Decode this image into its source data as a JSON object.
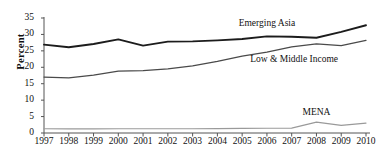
{
  "chart_data": {
    "type": "line",
    "title": "",
    "subtitle": "",
    "xlabel": "",
    "ylabel": "Percent",
    "x": [
      1997,
      1998,
      1999,
      2000,
      2001,
      2002,
      2003,
      2004,
      2005,
      2006,
      2007,
      2008,
      2009,
      2010
    ],
    "categories": [
      "1997",
      "1998",
      "1999",
      "2000",
      "2001",
      "2002",
      "2003",
      "2004",
      "2005",
      "2006",
      "2007",
      "2008",
      "2009",
      "2010"
    ],
    "xlim": [
      1997,
      2010
    ],
    "ylim": [
      0,
      35
    ],
    "yticks": [
      0,
      5,
      10,
      15,
      20,
      25,
      30,
      35
    ],
    "ytick_labels": [
      "0",
      "5",
      "10",
      "15",
      "20",
      "25",
      "30",
      "35"
    ],
    "grid": false,
    "legend_position": "inline-annotations",
    "series": [
      {
        "name": "Emerging Asia",
        "color": "#1c1c1c",
        "line_width": 1.9,
        "values": [
          26.9,
          26.1,
          27.1,
          28.5,
          26.6,
          27.8,
          27.9,
          28.2,
          28.6,
          29.4,
          29.3,
          29.0,
          30.8,
          32.8
        ],
        "label_x": 2006.0,
        "label_y": 33.6
      },
      {
        "name": "Low & Middle Income",
        "color": "#4a4a4a",
        "line_width": 1.25,
        "values": [
          17.0,
          16.8,
          17.6,
          18.8,
          19.0,
          19.5,
          20.4,
          21.8,
          23.4,
          24.6,
          26.2,
          27.1,
          26.6,
          28.2
        ],
        "label_x": 2007.1,
        "label_y": 22.6
      },
      {
        "name": "MENA",
        "color": "#9a9a9a",
        "line_width": 1.15,
        "values": [
          1.3,
          1.25,
          1.25,
          1.3,
          1.3,
          1.3,
          1.3,
          1.35,
          1.4,
          1.45,
          1.5,
          3.3,
          2.3,
          3.0
        ],
        "label_x": 2008.0,
        "label_y": 6.3
      }
    ],
    "annotations": [
      {
        "text": "Emerging Asia",
        "series": "Emerging Asia"
      },
      {
        "text": "Low & Middle Income",
        "series": "Low & Middle Income"
      },
      {
        "text": "MENA",
        "series": "MENA"
      }
    ],
    "axis": {
      "left_spine": true,
      "bottom_spine": true,
      "top_spine": false,
      "right_spine": false,
      "spine_color": "#555555"
    }
  }
}
